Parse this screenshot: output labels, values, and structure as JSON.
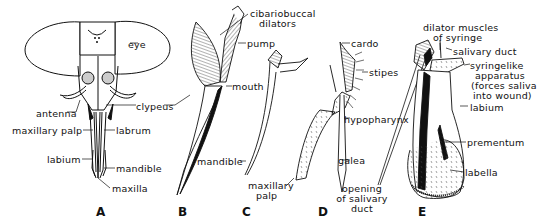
{
  "figure": {
    "panels": [
      {
        "id": "A",
        "letter": "A",
        "labels": {
          "eye": "eye",
          "antenna": "antenna",
          "clypeus": "clypeus",
          "maxillary_palp": "maxillary palp",
          "labrum": "labrum",
          "labium": "labium",
          "mandible": "mandible",
          "maxilla": "maxilla"
        }
      },
      {
        "id": "B",
        "letter": "B",
        "labels": {
          "cibariobuccal1": "cibariobuccal",
          "cibariobuccal2": "dilators",
          "pump": "pump",
          "mouth": "mouth"
        }
      },
      {
        "id": "C",
        "letter": "C",
        "labels": {
          "mandible": "mandible",
          "maxillary1": "maxillary",
          "maxillary2": "palp"
        }
      },
      {
        "id": "D",
        "letter": "D",
        "labels": {
          "cardo": "cardo",
          "stipes": "stipes",
          "hypopharynx": "hypopharynx",
          "galea": "galea",
          "opening1": "opening",
          "opening2": "of salivary",
          "opening3": "duct"
        }
      },
      {
        "id": "E",
        "letter": "E",
        "labels": {
          "dilator1": "dilator muscles",
          "dilator2": "of syringe",
          "salivary_duct": "salivary duct",
          "syringe1": "syringelike",
          "syringe2": "apparatus",
          "syringe3": "(forces saliva",
          "syringe4": "into wound)",
          "labium": "labium",
          "prementum": "prementum",
          "labella": "labella"
        }
      }
    ]
  }
}
